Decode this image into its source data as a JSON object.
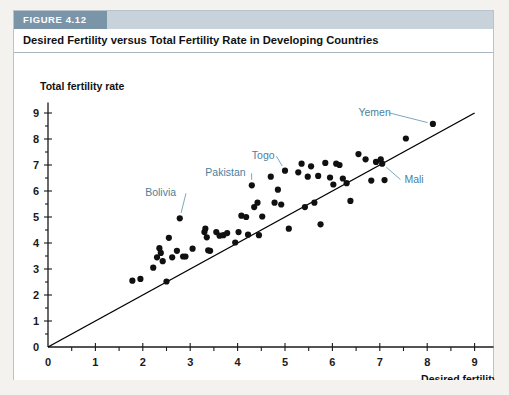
{
  "figure": {
    "tag": "FIGURE 4.12",
    "title": "Desired Fertility versus Total Fertility Rate in Developing Countries"
  },
  "chart_data": {
    "type": "scatter",
    "title": "Desired Fertility versus Total Fertility Rate in Developing Countries",
    "xlabel": "Desired fertility",
    "ylabel": "Total fertility rate",
    "xlim": [
      0,
      9.4
    ],
    "ylim": [
      0,
      9.4
    ],
    "xticks": [
      0,
      1,
      2,
      3,
      4,
      5,
      6,
      7,
      8,
      9
    ],
    "yticks": [
      0,
      1,
      2,
      3,
      4,
      5,
      6,
      7,
      8,
      9
    ],
    "xticklabels": [
      "0",
      "1",
      "2",
      "3",
      "4",
      "5",
      "6",
      "7",
      "8",
      "9"
    ],
    "yticklabels": [
      "0",
      "1",
      "2",
      "3",
      "4",
      "5",
      "6",
      "7",
      "8",
      "9"
    ],
    "grid": false,
    "legend": false,
    "reference_line": {
      "name": "45-degree line",
      "x": [
        0,
        9.0
      ],
      "y": [
        0,
        9.0
      ],
      "color": "#000000"
    },
    "marker_color": "#101010",
    "points": [
      {
        "x": 1.78,
        "y": 2.55
      },
      {
        "x": 1.95,
        "y": 2.62
      },
      {
        "x": 2.22,
        "y": 3.05
      },
      {
        "x": 2.3,
        "y": 3.45
      },
      {
        "x": 2.35,
        "y": 3.8
      },
      {
        "x": 2.38,
        "y": 3.62
      },
      {
        "x": 2.42,
        "y": 3.3
      },
      {
        "x": 2.5,
        "y": 2.52
      },
      {
        "x": 2.55,
        "y": 4.2
      },
      {
        "x": 2.62,
        "y": 3.45
      },
      {
        "x": 2.72,
        "y": 3.7
      },
      {
        "x": 2.78,
        "y": 4.95
      },
      {
        "x": 2.85,
        "y": 3.48
      },
      {
        "x": 2.9,
        "y": 3.48
      },
      {
        "x": 3.05,
        "y": 3.78
      },
      {
        "x": 3.3,
        "y": 4.42
      },
      {
        "x": 3.32,
        "y": 4.55
      },
      {
        "x": 3.35,
        "y": 4.22
      },
      {
        "x": 3.38,
        "y": 3.72
      },
      {
        "x": 3.42,
        "y": 3.7
      },
      {
        "x": 3.55,
        "y": 4.42
      },
      {
        "x": 3.62,
        "y": 4.28
      },
      {
        "x": 3.7,
        "y": 4.3
      },
      {
        "x": 3.78,
        "y": 4.38
      },
      {
        "x": 3.95,
        "y": 4.02
      },
      {
        "x": 4.02,
        "y": 4.42
      },
      {
        "x": 4.08,
        "y": 5.05
      },
      {
        "x": 4.18,
        "y": 5.0
      },
      {
        "x": 4.22,
        "y": 4.32
      },
      {
        "x": 4.3,
        "y": 6.22
      },
      {
        "x": 4.35,
        "y": 5.38
      },
      {
        "x": 4.42,
        "y": 5.55
      },
      {
        "x": 4.45,
        "y": 4.3
      },
      {
        "x": 4.52,
        "y": 5.02
      },
      {
        "x": 4.7,
        "y": 6.55
      },
      {
        "x": 4.78,
        "y": 5.55
      },
      {
        "x": 4.85,
        "y": 6.05
      },
      {
        "x": 4.92,
        "y": 5.48
      },
      {
        "x": 5.0,
        "y": 6.78
      },
      {
        "x": 5.08,
        "y": 4.55
      },
      {
        "x": 5.28,
        "y": 6.72
      },
      {
        "x": 5.35,
        "y": 7.05
      },
      {
        "x": 5.42,
        "y": 5.38
      },
      {
        "x": 5.48,
        "y": 6.55
      },
      {
        "x": 5.55,
        "y": 6.95
      },
      {
        "x": 5.62,
        "y": 5.55
      },
      {
        "x": 5.7,
        "y": 6.58
      },
      {
        "x": 5.75,
        "y": 4.72
      },
      {
        "x": 5.85,
        "y": 7.08
      },
      {
        "x": 5.95,
        "y": 6.52
      },
      {
        "x": 6.02,
        "y": 6.25
      },
      {
        "x": 6.08,
        "y": 7.05
      },
      {
        "x": 6.15,
        "y": 7.0
      },
      {
        "x": 6.22,
        "y": 6.48
      },
      {
        "x": 6.3,
        "y": 6.3
      },
      {
        "x": 6.38,
        "y": 5.62
      },
      {
        "x": 6.55,
        "y": 7.42
      },
      {
        "x": 6.7,
        "y": 7.22
      },
      {
        "x": 6.82,
        "y": 6.4
      },
      {
        "x": 6.92,
        "y": 7.12
      },
      {
        "x": 7.02,
        "y": 7.22
      },
      {
        "x": 7.05,
        "y": 7.05
      },
      {
        "x": 7.1,
        "y": 6.42
      },
      {
        "x": 7.55,
        "y": 8.02
      },
      {
        "x": 8.12,
        "y": 8.58
      }
    ],
    "annotations": [
      {
        "label": "Bolivia",
        "text_x": 2.05,
        "text_y": 5.95,
        "point_x": 2.78,
        "point_y": 4.95,
        "color": "#4b7f9c"
      },
      {
        "label": "Pakistan",
        "text_x": 3.32,
        "text_y": 6.72,
        "point_x": 4.3,
        "point_y": 6.22,
        "color": "#4b7f9c"
      },
      {
        "label": "Togo",
        "text_x": 4.3,
        "text_y": 7.38,
        "point_x": 5.0,
        "point_y": 6.78,
        "color": "#4b7f9c"
      },
      {
        "label": "Yemen",
        "text_x": 6.55,
        "text_y": 9.05,
        "point_x": 8.12,
        "point_y": 8.58,
        "color": "#4b7f9c"
      },
      {
        "label": "Mali",
        "text_x": 7.52,
        "text_y": 6.48,
        "point_x": 7.05,
        "point_y": 7.05,
        "color": "#4b7f9c"
      }
    ]
  }
}
